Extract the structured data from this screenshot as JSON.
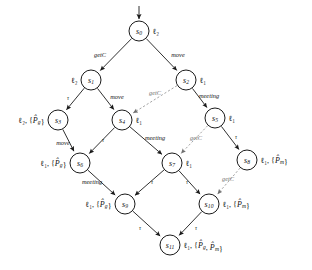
{
  "figure": {
    "type": "labeled-transition-system-diagram",
    "title": "",
    "background_color": "#ffffff",
    "solid_edge_color": "#1a1a1a",
    "dashed_edge_color": "#9a9a9a",
    "node_fill": "#ffffff",
    "node_stroke": "#1a1a1a"
  },
  "initial_arrow": {
    "label": "",
    "target": "s0"
  },
  "nodes": [
    {
      "id": "s0",
      "name": "s",
      "sub": "0",
      "x": 139,
      "y": 31,
      "r": 10,
      "state_label": "ℓ₂",
      "label_side": "right"
    },
    {
      "id": "s1",
      "name": "s",
      "sub": "1",
      "x": 91,
      "y": 80,
      "r": 10,
      "state_label": "ℓ₂",
      "label_side": "left"
    },
    {
      "id": "s2",
      "name": "s",
      "sub": "2",
      "x": 186,
      "y": 80,
      "r": 10,
      "state_label": "ℓ₁",
      "label_side": "right"
    },
    {
      "id": "s3",
      "name": "s",
      "sub": "3",
      "x": 58,
      "y": 120,
      "r": 10,
      "state_label": "ℓ₂, {P̂_g}",
      "label_side": "left"
    },
    {
      "id": "s4",
      "name": "s",
      "sub": "4",
      "x": 122,
      "y": 120,
      "r": 10,
      "state_label": "ℓ₁",
      "label_side": "right"
    },
    {
      "id": "s5",
      "name": "s",
      "sub": "5",
      "x": 215,
      "y": 118,
      "r": 10,
      "state_label": "ℓ₁",
      "label_side": "right"
    },
    {
      "id": "s6",
      "name": "s",
      "sub": "6",
      "x": 80,
      "y": 163,
      "r": 10,
      "state_label": "ℓ₁, {P̂_g}",
      "label_side": "left"
    },
    {
      "id": "s7",
      "name": "s",
      "sub": "7",
      "x": 172,
      "y": 163,
      "r": 10,
      "state_label": "ℓ₁",
      "label_side": "right"
    },
    {
      "id": "s8",
      "name": "s",
      "sub": "8",
      "x": 247,
      "y": 160,
      "r": 10,
      "state_label": "ℓ₁, {P̂_m}",
      "label_side": "right"
    },
    {
      "id": "s9",
      "name": "s",
      "sub": "9",
      "x": 125,
      "y": 204,
      "r": 10,
      "state_label": "ℓ₁, {P̂_g}",
      "label_side": "left"
    },
    {
      "id": "s10",
      "name": "s",
      "sub": "10",
      "x": 209,
      "y": 204,
      "r": 10,
      "state_label": "ℓ₁, {P̂_m}",
      "label_side": "right"
    },
    {
      "id": "s11",
      "name": "s",
      "sub": "11",
      "x": 170,
      "y": 245,
      "r": 10,
      "state_label": "ℓ₁, {P̂_g, P̂_m}",
      "label_side": "right"
    }
  ],
  "edges": [
    {
      "id": "e0",
      "from": "s0",
      "to": "s1",
      "label": "getC",
      "style": "solid",
      "label_x": 100,
      "label_y": 56
    },
    {
      "id": "e1",
      "from": "s0",
      "to": "s2",
      "label": "move",
      "style": "solid",
      "label_x": 178,
      "label_y": 56
    },
    {
      "id": "e2",
      "from": "s1",
      "to": "s3",
      "label": "τ",
      "style": "solid",
      "label_x": 68,
      "label_y": 99
    },
    {
      "id": "e3",
      "from": "s1",
      "to": "s4",
      "label": "move",
      "style": "solid",
      "label_x": 117,
      "label_y": 98
    },
    {
      "id": "e4",
      "from": "s2",
      "to": "s4",
      "label": "getC",
      "style": "dashed",
      "label_x": 155,
      "label_y": 94
    },
    {
      "id": "e5",
      "from": "s2",
      "to": "s5",
      "label": "meeting",
      "style": "solid",
      "label_x": 209,
      "label_y": 97
    },
    {
      "id": "e6",
      "from": "s3",
      "to": "s6",
      "label": "move",
      "style": "solid",
      "label_x": 63,
      "label_y": 144
    },
    {
      "id": "e7",
      "from": "s4",
      "to": "s6",
      "label": "τ",
      "style": "solid",
      "label_x": 103,
      "label_y": 141
    },
    {
      "id": "e8",
      "from": "s4",
      "to": "s7",
      "label": "meeting",
      "style": "solid",
      "label_x": 155,
      "label_y": 139
    },
    {
      "id": "e9",
      "from": "s5",
      "to": "s7",
      "label": "getC",
      "style": "dashed",
      "label_x": 196,
      "label_y": 139
    },
    {
      "id": "e10",
      "from": "s5",
      "to": "s8",
      "label": "τ",
      "style": "solid",
      "label_x": 236,
      "label_y": 138
    },
    {
      "id": "e11",
      "from": "s6",
      "to": "s9",
      "label": "meeting",
      "style": "solid",
      "label_x": 92,
      "label_y": 183
    },
    {
      "id": "e12",
      "from": "s7",
      "to": "s9",
      "label": "τ",
      "style": "solid",
      "label_x": 152,
      "label_y": 183
    },
    {
      "id": "e13",
      "from": "s7",
      "to": "s10",
      "label": "τ",
      "style": "solid",
      "label_x": 187,
      "label_y": 183
    },
    {
      "id": "e14",
      "from": "s8",
      "to": "s10",
      "label": "getC",
      "style": "dashed",
      "label_x": 228,
      "label_y": 180
    },
    {
      "id": "e15",
      "from": "s9",
      "to": "s11",
      "label": "τ",
      "style": "solid",
      "label_x": 140,
      "label_y": 229
    },
    {
      "id": "e16",
      "from": "s10",
      "to": "s11",
      "label": "τ",
      "style": "solid",
      "label_x": 196,
      "label_y": 229
    }
  ],
  "atomic_propositions": [
    "P̂_g",
    "P̂_m"
  ],
  "location_labels": [
    "ℓ₁",
    "ℓ₂"
  ],
  "actions": [
    "getC",
    "move",
    "meeting",
    "τ"
  ]
}
